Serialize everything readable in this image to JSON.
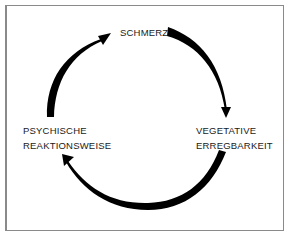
{
  "diagram": {
    "type": "cycle",
    "nodes": [
      {
        "id": "schmerz",
        "lines": [
          "SCHMERZ"
        ]
      },
      {
        "id": "vegetative",
        "lines": [
          "VEGETATIVE",
          "ERREGBARKEIT"
        ]
      },
      {
        "id": "psychische",
        "lines": [
          "PSYCHISCHE",
          "REAKTIONSWEISE"
        ]
      }
    ],
    "edges": [
      {
        "from": "schmerz",
        "to": "vegetative",
        "direction": "clockwise"
      },
      {
        "from": "vegetative",
        "to": "psychische",
        "direction": "clockwise"
      },
      {
        "from": "psychische",
        "to": "schmerz",
        "direction": "clockwise"
      }
    ],
    "colors": {
      "arrow": "#000000",
      "text": "#1a1a1a",
      "frame": "#8a8a8a"
    }
  }
}
